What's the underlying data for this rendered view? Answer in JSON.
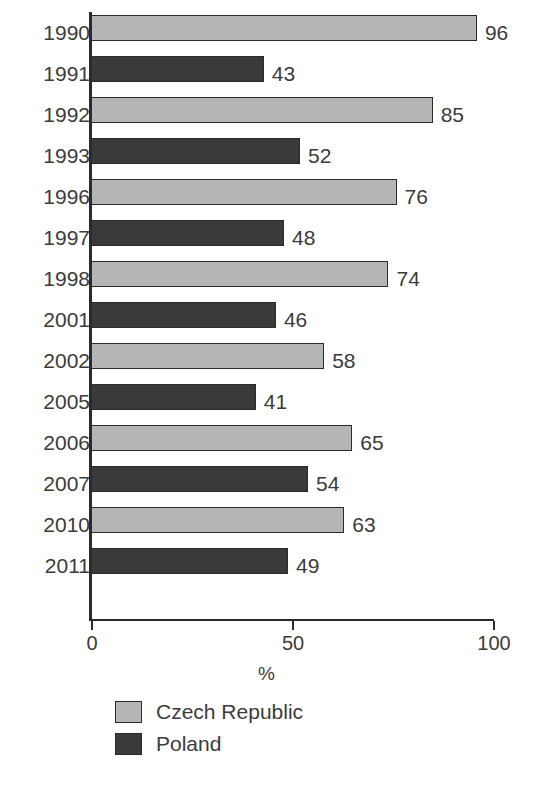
{
  "chart_data": {
    "type": "bar",
    "orientation": "horizontal",
    "title": "",
    "xlabel": "%",
    "ylabel": "",
    "xlim": [
      0,
      100
    ],
    "xticks": [
      0,
      50,
      100
    ],
    "xtick_labels": [
      "0",
      "50",
      "100"
    ],
    "grid": false,
    "legend_position": "bottom-left",
    "categories": [
      "1990",
      "1991",
      "1992",
      "1993",
      "1996",
      "1997",
      "1998",
      "2001",
      "2002",
      "2005",
      "2006",
      "2007",
      "2010",
      "2011"
    ],
    "values": [
      96,
      43,
      85,
      52,
      76,
      48,
      74,
      46,
      58,
      41,
      65,
      54,
      63,
      49
    ],
    "series": [
      {
        "name": "Czech Republic",
        "color": "#b5b5b5",
        "points": [
          {
            "category": "1990",
            "value": 96
          },
          {
            "category": "1992",
            "value": 85
          },
          {
            "category": "1996",
            "value": 76
          },
          {
            "category": "1998",
            "value": 74
          },
          {
            "category": "2002",
            "value": 58
          },
          {
            "category": "2006",
            "value": 65
          },
          {
            "category": "2010",
            "value": 63
          }
        ]
      },
      {
        "name": "Poland",
        "color": "#3a3a3a",
        "points": [
          {
            "category": "1991",
            "value": 43
          },
          {
            "category": "1993",
            "value": 52
          },
          {
            "category": "1997",
            "value": 48
          },
          {
            "category": "2001",
            "value": 46
          },
          {
            "category": "2005",
            "value": 41
          },
          {
            "category": "2007",
            "value": 54
          },
          {
            "category": "2011",
            "value": 49
          }
        ]
      }
    ],
    "bars": [
      {
        "category": "1990",
        "value": 96,
        "series": "Czech Republic",
        "label": "96"
      },
      {
        "category": "1991",
        "value": 43,
        "series": "Poland",
        "label": "43"
      },
      {
        "category": "1992",
        "value": 85,
        "series": "Czech Republic",
        "label": "85"
      },
      {
        "category": "1993",
        "value": 52,
        "series": "Poland",
        "label": "52"
      },
      {
        "category": "1996",
        "value": 76,
        "series": "Czech Republic",
        "label": "76"
      },
      {
        "category": "1997",
        "value": 48,
        "series": "Poland",
        "label": "48"
      },
      {
        "category": "1998",
        "value": 74,
        "series": "Czech Republic",
        "label": "74"
      },
      {
        "category": "2001",
        "value": 46,
        "series": "Poland",
        "label": "46"
      },
      {
        "category": "2002",
        "value": 58,
        "series": "Czech Republic",
        "label": "58"
      },
      {
        "category": "2005",
        "value": 41,
        "series": "Poland",
        "label": "41"
      },
      {
        "category": "2006",
        "value": 65,
        "series": "Czech Republic",
        "label": "65"
      },
      {
        "category": "2007",
        "value": 54,
        "series": "Poland",
        "label": "54"
      },
      {
        "category": "2010",
        "value": 63,
        "series": "Czech Republic",
        "label": "63"
      },
      {
        "category": "2011",
        "value": 49,
        "series": "Poland",
        "label": "49"
      }
    ],
    "legend": [
      {
        "label": "Czech Republic",
        "color": "#b5b5b5"
      },
      {
        "label": "Poland",
        "color": "#3a3a3a"
      }
    ]
  }
}
